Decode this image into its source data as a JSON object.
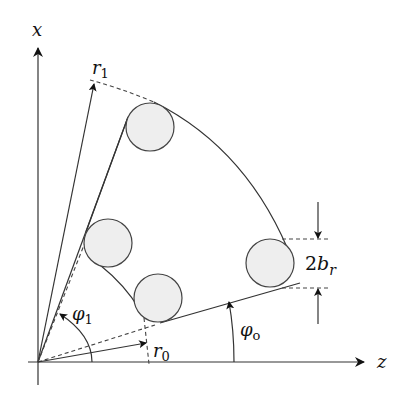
{
  "diagram": {
    "type": "geometry-schematic",
    "axes": {
      "vertical_label": "x",
      "horizontal_label": "z"
    },
    "labels": {
      "r1": "r",
      "r1_sub": "1",
      "r0": "r",
      "r0_sub": "0",
      "phi1": "φ",
      "phi1_sub": "1",
      "phi0": "φ",
      "phi0_sub": "o",
      "br_prefix": "2",
      "br": "b",
      "br_sub": "r"
    },
    "elements": {
      "circle_count": 4,
      "circle_fill": "#eeeeee",
      "stroke_color": "#333333"
    }
  }
}
